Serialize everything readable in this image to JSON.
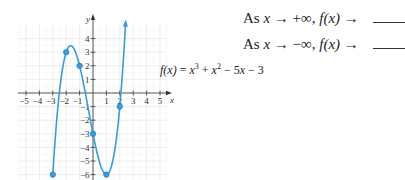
{
  "questions": [
    {
      "prefix": "As ",
      "var": "x",
      "arrow": " → ",
      "limit": "+∞",
      "mid": ", ",
      "fx": "f(x)",
      "arrow2": " → "
    },
    {
      "prefix": "As ",
      "var": "x",
      "arrow": " → ",
      "limit": "−∞",
      "mid": ", ",
      "fx": "f(x)",
      "arrow2": " → "
    }
  ],
  "function_label": {
    "lhs": "f(x)",
    "eq": " = ",
    "rhs_parts": [
      "x",
      "3",
      " + ",
      "x",
      "2",
      " − 5",
      "x",
      " − 3"
    ]
  },
  "colors": {
    "curve": "#3b9bd8",
    "grid": "#e6e6e6",
    "axis": "#333333"
  },
  "chart_data": {
    "type": "line",
    "title": "",
    "function": "f(x) = x^3 + x^2 - 5x - 3",
    "coefficients": [
      1,
      1,
      -5,
      -3
    ],
    "xlabel": "x",
    "ylabel": "y",
    "xlim": [
      -5.5,
      5.5
    ],
    "ylim": [
      -6.5,
      5
    ],
    "x_ticks": [
      -5,
      -4,
      -3,
      -2,
      -1,
      1,
      2,
      3,
      4,
      5
    ],
    "y_ticks": [
      -6,
      -5,
      -4,
      -3,
      -2,
      -1,
      1,
      2,
      3,
      4
    ],
    "grid": true,
    "curve_domain": [
      -3,
      2.43
    ],
    "end_arrow": "up-right",
    "points": [
      {
        "x": -3,
        "y": -6
      },
      {
        "x": -2,
        "y": 3
      },
      {
        "x": -1,
        "y": 2
      },
      {
        "x": 0,
        "y": -3
      },
      {
        "x": 1,
        "y": -6
      },
      {
        "x": 2,
        "y": -1
      }
    ],
    "label": "f(x) = x³ + x² − 5x − 3"
  }
}
